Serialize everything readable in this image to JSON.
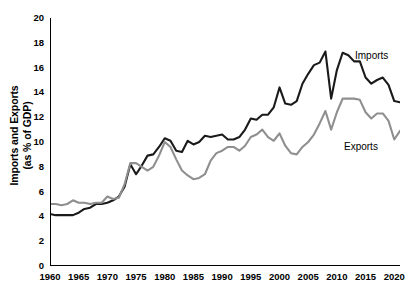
{
  "chart_data": {
    "type": "line",
    "title": "",
    "subtitle": "",
    "xlabel": "",
    "ylabel": "Imports and Exports (as % of GDP)",
    "ylabel_lines": [
      "Imports and Exports",
      "(as % of GDP)"
    ],
    "xlim": [
      1960,
      2021
    ],
    "ylim": [
      0,
      20
    ],
    "grid": false,
    "legend_position": "inline-right",
    "y_ticks": [
      0,
      2,
      4,
      6,
      8,
      10,
      12,
      14,
      16,
      18,
      20
    ],
    "y_tick_labels": [
      "0",
      "2",
      "4",
      "6",
      "8",
      "10",
      "12",
      "14",
      "16",
      "18",
      "20"
    ],
    "x_ticks": [
      1960,
      1965,
      1970,
      1975,
      1980,
      1985,
      1990,
      1995,
      2000,
      2005,
      2010,
      2015,
      2020
    ],
    "x_tick_labels": [
      "1960",
      "1965",
      "1970",
      "1975",
      "1980",
      "1985",
      "1990",
      "1995",
      "2000",
      "2005",
      "2010",
      "2015",
      "2020"
    ],
    "x": [
      1960,
      1961,
      1962,
      1963,
      1964,
      1965,
      1966,
      1967,
      1968,
      1969,
      1970,
      1971,
      1972,
      1973,
      1974,
      1975,
      1976,
      1977,
      1978,
      1979,
      1980,
      1981,
      1982,
      1983,
      1984,
      1985,
      1986,
      1987,
      1988,
      1989,
      1990,
      1991,
      1992,
      1993,
      1994,
      1995,
      1996,
      1997,
      1998,
      1999,
      2000,
      2001,
      2002,
      2003,
      2004,
      2005,
      2006,
      2007,
      2008,
      2009,
      2010,
      2011,
      2012,
      2013,
      2014,
      2015,
      2016,
      2017,
      2018,
      2019,
      2020,
      2021
    ],
    "series": [
      {
        "name": "Imports",
        "color": "#1a1a1a",
        "line_width": 2.1,
        "values": [
          4.2,
          4.1,
          4.1,
          4.1,
          4.1,
          4.3,
          4.6,
          4.7,
          5.0,
          5.0,
          5.1,
          5.3,
          5.6,
          6.4,
          8.2,
          7.4,
          8.1,
          8.9,
          9.0,
          9.6,
          10.3,
          10.1,
          9.3,
          9.2,
          10.1,
          9.8,
          10.0,
          10.5,
          10.4,
          10.5,
          10.6,
          10.2,
          10.2,
          10.4,
          11.0,
          11.9,
          11.8,
          12.2,
          12.2,
          12.8,
          14.4,
          13.1,
          13.0,
          13.3,
          14.7,
          15.5,
          16.2,
          16.4,
          17.3,
          13.5,
          15.8,
          17.2,
          17.0,
          16.5,
          16.5,
          15.2,
          14.7,
          15.0,
          15.2,
          14.6,
          13.3,
          13.2
        ]
      },
      {
        "name": "Exports",
        "color": "#8f8f8f",
        "line_width": 2.1,
        "values": [
          5.0,
          5.0,
          4.9,
          5.0,
          5.3,
          5.1,
          5.1,
          5.0,
          5.1,
          5.1,
          5.6,
          5.4,
          5.5,
          6.6,
          8.3,
          8.3,
          8.0,
          7.7,
          8.0,
          8.9,
          10.0,
          9.6,
          8.6,
          7.7,
          7.3,
          7.0,
          7.1,
          7.4,
          8.5,
          9.1,
          9.3,
          9.6,
          9.6,
          9.3,
          9.7,
          10.4,
          10.6,
          11.0,
          10.4,
          10.1,
          10.7,
          9.7,
          9.1,
          9.0,
          9.6,
          10.0,
          10.6,
          11.5,
          12.5,
          11.0,
          12.4,
          13.5,
          13.5,
          13.5,
          13.4,
          12.4,
          11.9,
          12.3,
          12.3,
          11.7,
          10.2,
          10.9
        ]
      }
    ],
    "annotations": [
      {
        "text": "Imports",
        "series": "Imports",
        "x": 2019,
        "y": 15.6
      },
      {
        "text": "Exports",
        "series": "Exports",
        "x": 2017,
        "y": 8.1
      }
    ]
  },
  "axis": {
    "y_title_line1": "Imports and Exports",
    "y_title_line2": "(as % of GDP)"
  },
  "labels": {
    "imports": "Imports",
    "exports": "Exports"
  },
  "colors": {
    "imports_line": "#1a1a1a",
    "exports_line": "#8f8f8f",
    "axis": "#000000",
    "background": "#ffffff"
  }
}
